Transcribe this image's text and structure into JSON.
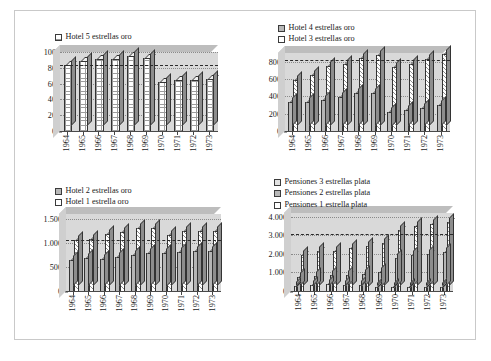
{
  "figure": {
    "caption": "",
    "years": [
      "1964",
      "1965",
      "1966",
      "1967",
      "1968",
      "1969",
      "1970",
      "1971",
      "1972",
      "1973"
    ]
  },
  "panels": [
    {
      "id": "hotel-5-estrellas-oro",
      "legend": [
        {
          "label": "Hotel 5 estrellas oro",
          "fill": "f-dot",
          "swatch": "sw-dot"
        }
      ],
      "yticks": [
        "0",
        "20",
        "40",
        "60",
        "80",
        "100"
      ]
    },
    {
      "id": "hotel-4-3-estrellas-oro",
      "legend": [
        {
          "label": "Hotel 4 estrellas oro",
          "fill": "f-grey",
          "swatch": "sw-grey"
        },
        {
          "label": "Hotel 3 estrellas oro",
          "fill": "f-hatch",
          "swatch": "sw-white"
        }
      ],
      "yticks": [
        "0",
        "200",
        "400",
        "600",
        "800"
      ]
    },
    {
      "id": "hotel-2-1-estrellas-oro",
      "legend": [
        {
          "label": "Hotel 2 estrellas oro",
          "fill": "f-grey",
          "swatch": "sw-grey"
        },
        {
          "label": "Hotel 1 estrella oro",
          "fill": "f-hatch",
          "swatch": "sw-white"
        }
      ],
      "yticks": [
        "0",
        "500",
        "1.000",
        "1.500"
      ]
    },
    {
      "id": "pensiones-estrellas-plata",
      "legend": [
        {
          "label": "Pensiones 3 estrellas plata",
          "fill": "f-light",
          "swatch": "sw-light"
        },
        {
          "label": "Pensiones 2 estrellas plata",
          "fill": "f-grey",
          "swatch": "sw-grey"
        },
        {
          "label": "Pensiones 1 estrella plata",
          "fill": "f-hatch",
          "swatch": "sw-white"
        }
      ],
      "yticks": [
        "0",
        "1.000",
        "2.000",
        "3.000",
        "4.000"
      ]
    }
  ],
  "chart_data": [
    {
      "type": "bar",
      "title": "Hotel 5 estrellas oro",
      "xlabel": "",
      "ylabel": "",
      "categories": [
        "1964",
        "1965",
        "1966",
        "1967",
        "1968",
        "1969",
        "1970",
        "1971",
        "1972",
        "1973"
      ],
      "ylim": [
        0,
        100
      ],
      "yticks": [
        0,
        20,
        40,
        60,
        80,
        100
      ],
      "grid": true,
      "legend_position": "top-left",
      "reference_line": 84,
      "series": [
        {
          "name": "Hotel 5 estrellas oro",
          "values": [
            84,
            88,
            91,
            91,
            95,
            93,
            62,
            64,
            65,
            66
          ]
        }
      ]
    },
    {
      "type": "bar",
      "title": "Hotel 4 y 3 estrellas oro",
      "xlabel": "",
      "ylabel": "",
      "categories": [
        "1964",
        "1965",
        "1966",
        "1967",
        "1968",
        "1969",
        "1970",
        "1971",
        "1972",
        "1973"
      ],
      "ylim": [
        0,
        900
      ],
      "yticks": [
        0,
        200,
        400,
        600,
        800
      ],
      "grid": true,
      "legend_position": "top-left",
      "reference_line": 820,
      "series": [
        {
          "name": "Hotel 4 estrellas oro",
          "values": [
            330,
            340,
            355,
            390,
            440,
            435,
            225,
            240,
            270,
            305
          ]
        },
        {
          "name": "Hotel 3 estrellas oro",
          "values": [
            590,
            650,
            745,
            775,
            845,
            880,
            740,
            775,
            830,
            885
          ]
        }
      ]
    },
    {
      "type": "bar",
      "title": "Hotel 2 y 1 estrella oro",
      "xlabel": "",
      "ylabel": "",
      "categories": [
        "1964",
        "1965",
        "1966",
        "1967",
        "1968",
        "1969",
        "1970",
        "1971",
        "1972",
        "1973"
      ],
      "ylim": [
        0,
        1600
      ],
      "yticks": [
        0,
        500,
        1000,
        1500
      ],
      "grid": true,
      "legend_position": "top-left",
      "reference_line": 1050,
      "series": [
        {
          "name": "Hotel 2 estrellas oro",
          "values": [
            650,
            680,
            670,
            700,
            740,
            790,
            800,
            820,
            830,
            840
          ]
        },
        {
          "name": "Hotel 1 estrella oro",
          "values": [
            1050,
            1080,
            1180,
            1230,
            1300,
            1310,
            1170,
            1240,
            1250,
            1250
          ]
        }
      ]
    },
    {
      "type": "bar",
      "title": "Pensiones estrellas plata",
      "xlabel": "",
      "ylabel": "",
      "categories": [
        "1964",
        "1965",
        "1966",
        "1967",
        "1968",
        "1969",
        "1970",
        "1971",
        "1972",
        "1973"
      ],
      "ylim": [
        0,
        4200
      ],
      "yticks": [
        0,
        1000,
        2000,
        3000,
        4000
      ],
      "grid": true,
      "legend_position": "top-left",
      "reference_line": 3050,
      "series": [
        {
          "name": "Pensiones 3 estrellas plata",
          "values": [
            290,
            330,
            390,
            320,
            340,
            210,
            190,
            200,
            210,
            230
          ]
        },
        {
          "name": "Pensiones 2 estrellas plata",
          "values": [
            740,
            810,
            840,
            880,
            940,
            1050,
            1800,
            1950,
            2000,
            2080
          ]
        },
        {
          "name": "Pensiones 1 estrella plata",
          "values": [
            1950,
            2150,
            2180,
            2320,
            2450,
            2560,
            3280,
            3480,
            3600,
            3740
          ]
        }
      ]
    }
  ]
}
